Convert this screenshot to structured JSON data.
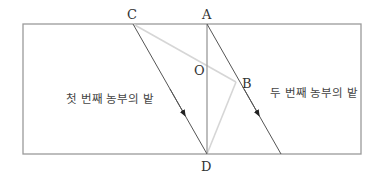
{
  "diagram": {
    "colors": {
      "frame": "#9a9a9a",
      "dark_line": "#555555",
      "light_line": "#d6d6d6",
      "text": "#333333"
    },
    "points": {
      "A": {
        "label": "A"
      },
      "B": {
        "label": "B"
      },
      "C": {
        "label": "C"
      },
      "D": {
        "label": "D"
      },
      "O": {
        "label": "O"
      }
    },
    "fields": {
      "first": {
        "label": "첫 번째 농부의 밭"
      },
      "second": {
        "label": "두 번째 농부의 밭"
      }
    }
  }
}
